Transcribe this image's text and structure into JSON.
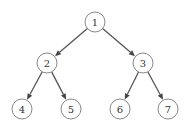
{
  "diagram": {
    "type": "binary-tree",
    "node_radius": 10,
    "colors": {
      "edge": "#555555",
      "node_stroke": "#7a7a7a",
      "text": "#333333",
      "background": "#ffffff"
    },
    "nodes": [
      {
        "id": "1",
        "label": "1",
        "x": 95,
        "y": 22
      },
      {
        "id": "2",
        "label": "2",
        "x": 47,
        "y": 63
      },
      {
        "id": "3",
        "label": "3",
        "x": 143,
        "y": 63
      },
      {
        "id": "4",
        "label": "4",
        "x": 22,
        "y": 109
      },
      {
        "id": "5",
        "label": "5",
        "x": 71,
        "y": 109
      },
      {
        "id": "6",
        "label": "6",
        "x": 120,
        "y": 109
      },
      {
        "id": "7",
        "label": "7",
        "x": 168,
        "y": 109
      }
    ],
    "edges": [
      {
        "from": "1",
        "to": "2"
      },
      {
        "from": "1",
        "to": "3"
      },
      {
        "from": "2",
        "to": "4"
      },
      {
        "from": "2",
        "to": "5"
      },
      {
        "from": "3",
        "to": "6"
      },
      {
        "from": "3",
        "to": "7"
      }
    ]
  }
}
